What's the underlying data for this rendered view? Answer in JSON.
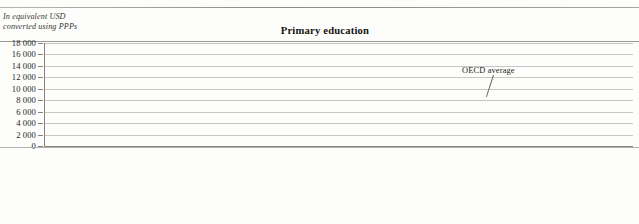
{
  "header": {
    "subcaption_line1": "In equivalent USD",
    "subcaption_line2": "converted using PPPs"
  },
  "chart_data": {
    "type": "bar",
    "title": "Primary education",
    "xlabel": "",
    "ylabel": "In equivalent USD converted using PPPs",
    "ylim": [
      0,
      18000
    ],
    "ytick_labels": [
      "18 000",
      "16 000",
      "14 000",
      "12 000",
      "10 000",
      "8 000",
      "6 000",
      "4 000",
      "2 000",
      "0"
    ],
    "ytick_values": [
      18000,
      16000,
      14000,
      12000,
      10000,
      8000,
      6000,
      4000,
      2000,
      0
    ],
    "grid": true,
    "legend_position": "none",
    "annotations": [
      {
        "label": "OECD average",
        "value": 8000,
        "type": "reference-line"
      }
    ],
    "categories": [
      "Luxembourg",
      "Norway",
      "Denmark",
      "United States",
      "Switzerland",
      "Iceland",
      "Austria",
      "Sweden",
      "United Kingdom",
      "Italy",
      "Belgium",
      "Australia",
      "Ireland",
      "Netherlands",
      "Japan",
      "Spain",
      "Finland",
      "New Zealand",
      "Korea",
      "Germany",
      "France",
      "Portugal",
      "Estonia",
      "Poland",
      "Israel",
      "Slovak Republic",
      "Hungary",
      "Czech Republic",
      "Chile",
      "Argentina",
      "Brazil",
      "Mexico",
      "South Africa"
    ],
    "category_footnotes": [
      "",
      "",
      "1",
      "",
      "2",
      "",
      "",
      "",
      "",
      "1",
      "",
      "",
      "1",
      "",
      "1",
      "",
      "",
      "",
      "",
      "",
      "",
      "2",
      "2",
      "2",
      "",
      "",
      "2",
      "2",
      "",
      "2",
      "2",
      "",
      ""
    ],
    "values": [
      16900,
      11200,
      10200,
      10000,
      9800,
      9400,
      9300,
      9000,
      8900,
      8700,
      8600,
      8500,
      8300,
      8200,
      8100,
      7900,
      7600,
      7400,
      7100,
      7000,
      6700,
      6400,
      6200,
      6000,
      5900,
      5700,
      5200,
      5000,
      4300,
      3800,
      3000,
      2600,
      1600
    ],
    "values_note": "values estimated from gridlines, in equivalent USD converted using PPPs",
    "series": [
      {
        "name": "Annual expenditure per student",
        "values": [
          16900,
          11200,
          10200,
          10000,
          9800,
          9400,
          9300,
          9000,
          8900,
          8700,
          8600,
          8500,
          8300,
          8200,
          8100,
          7900,
          7600,
          7400,
          7100,
          7000,
          6700,
          6400,
          6200,
          6000,
          5900,
          5700,
          5200,
          5000,
          4300,
          3800,
          3000,
          2600,
          1600
        ]
      }
    ]
  },
  "colors": {
    "bar": "#5a5653",
    "gridline": "#c9c6c1",
    "oecd_line": "#201c19",
    "text": "#231f1c"
  }
}
